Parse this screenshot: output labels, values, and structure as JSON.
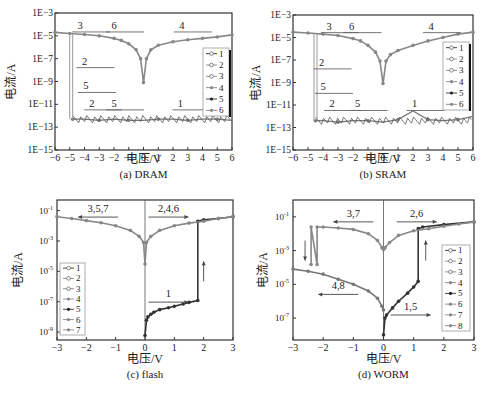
{
  "chart_data": [
    {
      "id": "a",
      "type": "line",
      "title": "(a) DRAM",
      "xlabel": "电压/V",
      "ylabel": "电流/A",
      "yscale": "log",
      "xlim": [
        -6,
        6
      ],
      "ylim": [
        1e-15,
        0.001
      ],
      "xticks": [
        "-6",
        "-5",
        "-4",
        "-3",
        "-2",
        "-1",
        "0",
        "1",
        "2",
        "3",
        "4",
        "5",
        "6"
      ],
      "yticks": [
        "1E-3",
        "1E-5",
        "1E-7",
        "1E-9",
        "1E-11",
        "1E-13",
        "1E-15"
      ],
      "legend": [
        "1",
        "2",
        "3",
        "4",
        "5",
        "6"
      ],
      "legend_position": "right-middle",
      "annotations": [
        {
          "text": "3",
          "x": -4.3,
          "y": 4e-05
        },
        {
          "text": "6",
          "x": -2.0,
          "y": 4e-05
        },
        {
          "text": "4",
          "x": 2.6,
          "y": 4e-05
        },
        {
          "text": "2",
          "x": -4.0,
          "y": 3e-08
        },
        {
          "text": "5",
          "x": -3.9,
          "y": 2e-10
        },
        {
          "text": "2",
          "x": -3.5,
          "y": 6e-12
        },
        {
          "text": "5",
          "x": -2.0,
          "y": 6e-12
        },
        {
          "text": "1",
          "x": 2.5,
          "y": 6e-12
        }
      ],
      "series": [
        {
          "name": "ON state (3,4,6)",
          "x": [
            -6,
            -5,
            -4,
            -3,
            -2,
            -1.5,
            -1,
            -0.5,
            -0.2,
            0,
            0.2,
            0.5,
            1,
            2,
            3,
            4,
            5,
            6
          ],
          "y": [
            2e-05,
            1.6e-05,
            1.3e-05,
            1e-05,
            6e-06,
            4e-06,
            2e-06,
            6e-07,
            1e-07,
            8e-10,
            1e-07,
            6e-07,
            1.5e-06,
            3e-06,
            4.5e-06,
            6e-06,
            8e-06,
            1.2e-05
          ]
        },
        {
          "name": "OFF state (1,2,5)",
          "x": [
            -4.8,
            -4,
            -3,
            -2,
            -1,
            0,
            1,
            2,
            3,
            4,
            5,
            6
          ],
          "y": [
            5e-13,
            5e-13,
            4e-13,
            5e-13,
            4e-13,
            4e-13,
            5e-13,
            5e-13,
            4e-13,
            5e-13,
            5e-13,
            4e-13
          ]
        },
        {
          "name": "switch",
          "x": [
            -5,
            -5,
            -4.8,
            -4.8
          ],
          "y": [
            1.5e-05,
            5e-13,
            1.5e-05,
            5e-13
          ]
        }
      ]
    },
    {
      "id": "b",
      "type": "line",
      "title": "(b) SRAM",
      "xlabel": "电压/V",
      "ylabel": "电流/A",
      "yscale": "log",
      "xlim": [
        -6,
        6
      ],
      "ylim": [
        1e-15,
        0.001
      ],
      "xticks": [
        "-6",
        "-5",
        "-4",
        "-3",
        "-2",
        "-1",
        "0",
        "1",
        "2",
        "3",
        "4",
        "5",
        "6"
      ],
      "yticks": [
        "1E-3",
        "1E-5",
        "1E-7",
        "1E-9",
        "1E-11",
        "1E-13",
        "1E-15"
      ],
      "legend": [
        "1",
        "2",
        "3",
        "4",
        "5",
        "6"
      ],
      "legend_position": "right-middle",
      "annotations": [
        {
          "text": "3",
          "x": -3.6,
          "y": 5e-05
        },
        {
          "text": "6",
          "x": -2.1,
          "y": 5e-05
        },
        {
          "text": "4",
          "x": 3.2,
          "y": 5e-05
        },
        {
          "text": "2",
          "x": -4.1,
          "y": 3e-08
        },
        {
          "text": "5",
          "x": -4.0,
          "y": 2e-10
        },
        {
          "text": "2",
          "x": -3.4,
          "y": 6e-12
        },
        {
          "text": "5",
          "x": -1.7,
          "y": 6e-12
        },
        {
          "text": "1",
          "x": 2.1,
          "y": 6e-12
        }
      ],
      "series": [
        {
          "name": "ON state (3,4,6)",
          "x": [
            -6,
            -5,
            -4,
            -3,
            -2,
            -1.5,
            -1,
            -0.5,
            -0.2,
            0,
            0.2,
            0.5,
            1,
            2,
            3,
            4,
            5,
            6
          ],
          "y": [
            3e-05,
            2.5e-05,
            2e-05,
            1.5e-05,
            8e-06,
            5e-06,
            2e-06,
            5e-07,
            8e-08,
            8e-10,
            8e-08,
            3e-07,
            7e-07,
            2e-06,
            5e-06,
            1e-05,
            2e-05,
            3e-05
          ]
        },
        {
          "name": "OFF state (1,2,5)",
          "x": [
            -4.5,
            -4,
            -3,
            -2,
            -1,
            0,
            1,
            2,
            3,
            4,
            5,
            6
          ],
          "y": [
            4e-13,
            4e-13,
            3e-13,
            4e-13,
            4e-13,
            3e-13,
            5e-13,
            3e-12,
            5e-13,
            4e-13,
            5e-13,
            1e-12
          ]
        },
        {
          "name": "switch",
          "x": [
            -4.6,
            -4.6,
            -4.4,
            -4.4
          ],
          "y": [
            2e-05,
            4e-13,
            2e-05,
            4e-13
          ]
        }
      ]
    },
    {
      "id": "c",
      "type": "line",
      "title": "(c) flash",
      "xlabel": "电压/V",
      "ylabel": "电流/A",
      "yscale": "log",
      "xlim": [
        -3,
        3
      ],
      "ylim": [
        3e-10,
        0.5
      ],
      "xticks": [
        "-3",
        "-2",
        "-1",
        "0",
        "1",
        "2",
        "3"
      ],
      "yticks": [
        "10^-1",
        "10^-3",
        "10^-5",
        "10^-7",
        "10^-9"
      ],
      "legend": [
        "1",
        "2",
        "3",
        "4",
        "5",
        "6",
        "7"
      ],
      "legend_position": "left-lower",
      "annotations": [
        {
          "text": "3,5,7",
          "x": -1.6,
          "y": 0.08,
          "arrow": "left"
        },
        {
          "text": "2,4,6",
          "x": 0.8,
          "y": 0.08,
          "arrow": "right"
        },
        {
          "text": "1",
          "x": 0.8,
          "y": 2e-07,
          "arrow": "right"
        },
        {
          "text": "",
          "x": 2.0,
          "y": 1e-05,
          "arrow": "up"
        }
      ],
      "series": [
        {
          "name": "1",
          "x": [
            0,
            0.05,
            0.1,
            0.2,
            0.3,
            0.5,
            0.8,
            1.0,
            1.3,
            1.5,
            1.8,
            1.8,
            2.0,
            2.5,
            3.0
          ],
          "y": [
            6e-10,
            6e-09,
            1e-08,
            1.5e-08,
            2e-08,
            3e-08,
            4e-08,
            5e-08,
            7e-08,
            9e-08,
            1.2e-07,
            0.02,
            0.025,
            0.03,
            0.04
          ]
        },
        {
          "name": "ON (2-7)",
          "x": [
            -3,
            -2.5,
            -2,
            -1.5,
            -1,
            -0.5,
            -0.2,
            -0.05,
            0,
            0.05,
            0.2,
            0.5,
            1,
            1.5,
            2,
            2.5,
            3
          ],
          "y": [
            0.04,
            0.03,
            0.022,
            0.016,
            0.01,
            0.005,
            0.002,
            0.0008,
            3e-05,
            0.0008,
            0.002,
            0.005,
            0.01,
            0.015,
            0.02,
            0.03,
            0.04
          ]
        }
      ]
    },
    {
      "id": "d",
      "type": "line",
      "title": "(d) WORM",
      "xlabel": "电压/V",
      "ylabel": "电流/A",
      "yscale": "log",
      "xlim": [
        -3,
        3
      ],
      "ylim": [
        5e-09,
        1
      ],
      "xticks": [
        "-3",
        "-2",
        "-1",
        "0",
        "1",
        "2",
        "3"
      ],
      "yticks": [
        "10^-1",
        "10^-3",
        "10^-5",
        "10^-7"
      ],
      "legend": [
        "1",
        "2",
        "3",
        "4",
        "5",
        "6",
        "7",
        "8"
      ],
      "legend_position": "right-lower",
      "annotations": [
        {
          "text": "3,7",
          "x": -1.0,
          "y": 0.1,
          "arrow": "left"
        },
        {
          "text": "2,6",
          "x": 1.1,
          "y": 0.1,
          "arrow": "right"
        },
        {
          "text": "4,8",
          "x": -1.5,
          "y": 5e-06,
          "arrow": "left"
        },
        {
          "text": "1,5",
          "x": 0.9,
          "y": 3e-07,
          "arrow": "right"
        },
        {
          "text": "",
          "x": -2.6,
          "y": 0.001,
          "arrow": "down"
        },
        {
          "text": "",
          "x": 1.4,
          "y": 0.001,
          "arrow": "up"
        }
      ],
      "series": [
        {
          "name": "1,5 (forward OFF)",
          "x": [
            0,
            0.05,
            0.1,
            0.3,
            0.5,
            0.8,
            1.0,
            1.15,
            1.15,
            1.3,
            2,
            3
          ],
          "y": [
            1e-08,
            1e-07,
            1.5e-07,
            4e-07,
            1e-06,
            3e-06,
            7e-06,
            1.5e-05,
            0.02,
            0.025,
            0.035,
            0.05
          ]
        },
        {
          "name": "2,6 (forward ON)",
          "x": [
            0,
            0.05,
            0.2,
            0.5,
            1,
            1.5,
            2,
            2.5,
            3
          ],
          "y": [
            0.0012,
            0.0015,
            0.003,
            0.008,
            0.015,
            0.02,
            0.028,
            0.038,
            0.05
          ]
        },
        {
          "name": "3,7 (reverse ON)",
          "x": [
            0,
            -0.05,
            -0.2,
            -0.5,
            -1,
            -1.5,
            -2,
            -2.2,
            -2.2,
            -2.4,
            -2.4
          ],
          "y": [
            0.0012,
            0.0015,
            0.004,
            0.01,
            0.018,
            0.022,
            0.025,
            0.025,
            0.00015,
            0.025,
            0.00015
          ]
        },
        {
          "name": "4,8 (reverse OFF)",
          "x": [
            0,
            -0.05,
            -0.2,
            -0.5,
            -1,
            -1.5,
            -2,
            -2.5,
            -3
          ],
          "y": [
            3e-07,
            5e-07,
            1.5e-06,
            4e-06,
            1e-05,
            2e-05,
            4e-05,
            6e-05,
            8e-05
          ]
        }
      ]
    }
  ]
}
